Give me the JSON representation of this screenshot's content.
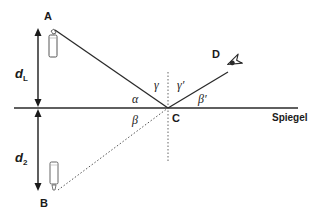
{
  "diagram": {
    "colors": {
      "line": "#2a2a2a",
      "dotted": "#555555",
      "background": "#ffffff"
    },
    "points": {
      "A": {
        "label": "A",
        "x": 52,
        "y": 30
      },
      "B": {
        "label": "B",
        "x": 56,
        "y": 193
      },
      "C": {
        "label": "C",
        "x": 168,
        "y": 108
      },
      "D": {
        "label": "D",
        "x": 230,
        "y": 70
      }
    },
    "mirror": {
      "label": "Spiegel",
      "y": 108,
      "x1": 14,
      "x2": 298
    },
    "distances": {
      "d_L": {
        "label": "d",
        "sub": "L"
      },
      "d_2": {
        "label": "d",
        "sub": "2"
      }
    },
    "angles": {
      "alpha": "α",
      "beta": "β",
      "gamma": "γ",
      "gamma_prime": "γ′",
      "beta_prime": "β′"
    },
    "icons": {
      "object_candle": "candle-icon",
      "image_candle": "candle-image-icon",
      "observer": "eye-icon"
    }
  }
}
